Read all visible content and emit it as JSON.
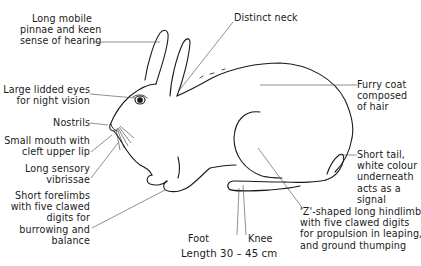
{
  "diagram": {
    "type": "labelled anatomical illustration",
    "labels": {
      "ears": "Long mobile\npinnae and keen\nsense of hearing",
      "eyes": "Large lidded eyes\nfor night vision",
      "nostrils": "Nostrils",
      "mouth": "Small mouth with\ncleft upper lip",
      "vibrissae": "Long sensory\nvibrissae",
      "forelimbs": "Short forelimbs\nwith five clawed\ndigits for\nburrowing and\nbalance",
      "neck": "Distinct neck",
      "coat": "Furry coat\ncomposed\nof hair",
      "tail": "Short tail,\nwhite colour\nunderneath\nacts as a\nsignal",
      "hindlimb": "'Z'-shaped long hindlimb\nwith five clawed digits\nfor propulsion in leaping,\nand ground thumping",
      "foot": "Foot",
      "knee": "Knee"
    },
    "caption": "Length 30 – 45 cm"
  }
}
